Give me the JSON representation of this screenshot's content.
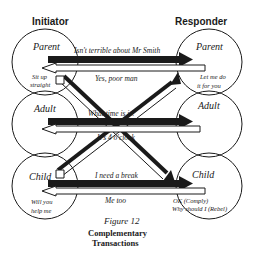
{
  "headers": {
    "initiator": "Initiator",
    "responder": "Responder"
  },
  "initiator_states": {
    "parent": "Parent",
    "adult": "Adult",
    "child": "Child"
  },
  "responder_states": {
    "parent": "Parent",
    "adult": "Adult",
    "child": "Child"
  },
  "transactions": {
    "parent_stimulus": "Isn't terrible about Mr Smith",
    "parent_response": "Yes, poor man",
    "adult_stimulus": "What time is it?",
    "adult_response": "It's 4 o'clock",
    "child_stimulus": "I need a break",
    "child_response": "Me too"
  },
  "notes": {
    "initiator_parent_line1": "Sit up",
    "initiator_parent_line2": "straight",
    "responder_parent_line1": "Let me do",
    "responder_parent_line2": "it for you",
    "initiator_child_line1": "Will you",
    "initiator_child_line2": "help me",
    "responder_child_line1": "OK (Comply)",
    "responder_child_line2": "Why should I (Rebel)"
  },
  "caption": {
    "figure": "Figure 12",
    "title_line1": "Complementary",
    "title_line2": "Transactions"
  },
  "colors": {
    "ink": "#1a1a1a",
    "background": "#ffffff"
  }
}
